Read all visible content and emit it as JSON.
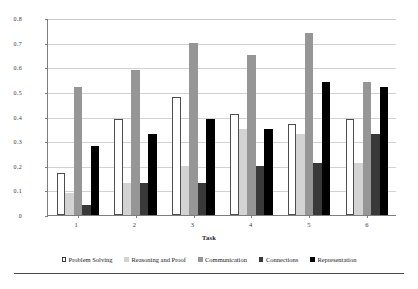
{
  "chart_data": {
    "type": "bar",
    "title": "",
    "xlabel": "Task",
    "ylabel": "Percentage Elicited",
    "categories": [
      "1",
      "2",
      "3",
      "4",
      "5",
      "6"
    ],
    "ylim": [
      0,
      0.8
    ],
    "yticks": [
      "0",
      "0.1",
      "0.2",
      "0.3",
      "0.4",
      "0.5",
      "0.6",
      "0.7",
      "0.8"
    ],
    "ytick_values": [
      0,
      0.1,
      0.2,
      0.3,
      0.4,
      0.5,
      0.6,
      0.7,
      0.8
    ],
    "grid": true,
    "legend_position": "bottom",
    "series": [
      {
        "name": "Problem Solving",
        "marker": "hollow-square",
        "color": "#ffffff",
        "values": [
          0.17,
          0.39,
          0.48,
          0.41,
          0.37,
          0.39
        ]
      },
      {
        "name": "Reasoning and Proof",
        "marker": "filled-square",
        "color": "#d3d3d3",
        "values": [
          0.09,
          0.13,
          0.2,
          0.35,
          0.33,
          0.21
        ]
      },
      {
        "name": "Communication",
        "marker": "filled-square",
        "color": "#969696",
        "values": [
          0.52,
          0.59,
          0.7,
          0.65,
          0.74,
          0.54
        ]
      },
      {
        "name": "Connections",
        "marker": "filled-square",
        "color": "#393939",
        "values": [
          0.04,
          0.13,
          0.13,
          0.2,
          0.21,
          0.33
        ]
      },
      {
        "name": "Representation",
        "marker": "filled-square",
        "color": "#000000",
        "values": [
          0.28,
          0.33,
          0.39,
          0.35,
          0.54,
          0.52
        ]
      }
    ]
  }
}
